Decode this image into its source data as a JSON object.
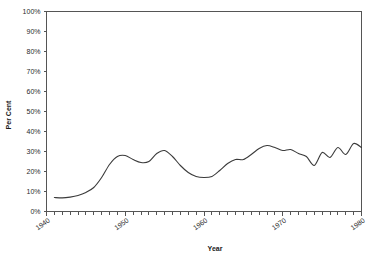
{
  "chart_data": {
    "type": "line",
    "title": "",
    "xlabel": "Year",
    "ylabel": "Per Cent",
    "xlim": [
      1940,
      1980
    ],
    "ylim": [
      0,
      100
    ],
    "grid": false,
    "legend": null,
    "x_ticks_major": [
      "1940",
      "1950",
      "1960",
      "1970",
      "1980"
    ],
    "x_tick_values": [
      1940,
      1950,
      1960,
      1970,
      1980
    ],
    "x_minor_tick_interval": 1,
    "y_ticks": [
      "0%",
      "10%",
      "20%",
      "30%",
      "40%",
      "50%",
      "60%",
      "70%",
      "80%",
      "90%",
      "100%"
    ],
    "y_tick_values": [
      0,
      10,
      20,
      30,
      40,
      50,
      60,
      70,
      80,
      90,
      100
    ],
    "series": [
      {
        "name": "Per Cent",
        "color": "#3b3b3b",
        "x": [
          1941,
          1942,
          1943,
          1944,
          1945,
          1946,
          1947,
          1948,
          1949,
          1950,
          1951,
          1952,
          1953,
          1954,
          1955,
          1956,
          1957,
          1958,
          1959,
          1960,
          1961,
          1962,
          1963,
          1964,
          1965,
          1966,
          1967,
          1968,
          1969,
          1970,
          1971,
          1972,
          1973,
          1974,
          1975,
          1976,
          1977,
          1978,
          1979,
          1980
        ],
        "values": [
          7.0,
          6.8,
          7.2,
          8.0,
          9.5,
          12.0,
          17.0,
          23.5,
          27.5,
          28.0,
          26.0,
          24.5,
          25.0,
          29.0,
          30.5,
          27.5,
          23.0,
          19.5,
          17.5,
          17.0,
          17.5,
          20.5,
          24.0,
          26.0,
          26.0,
          28.5,
          31.5,
          33.0,
          32.0,
          30.5,
          31.0,
          29.0,
          27.5,
          23.0,
          29.5,
          27.0,
          32.0,
          28.5,
          34.0,
          32.0
        ]
      }
    ]
  },
  "axis": {
    "y_title": "Per Cent",
    "x_title": "Year"
  }
}
